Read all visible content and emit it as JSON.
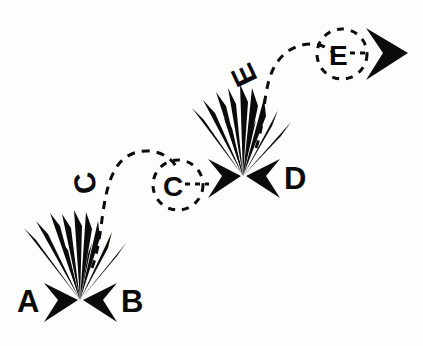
{
  "figure": {
    "title": "",
    "background_color": "#fdfdfc",
    "ink_color": "#0b0b0b",
    "width": 423,
    "height": 346
  },
  "labels": {
    "a": "A",
    "b": "B",
    "c_trajectory": "C",
    "c_circle": "C",
    "d": "D",
    "e_trajectory": "E",
    "e_circle": "E"
  },
  "events": [
    {
      "name": "first-collision",
      "incoming": [
        "A",
        "B"
      ],
      "outgoing": [
        "C"
      ],
      "vertex": [
        80,
        300
      ]
    },
    {
      "name": "second-collision",
      "incoming": [
        "C",
        "D"
      ],
      "outgoing": [
        "E"
      ],
      "vertex": [
        243,
        176
      ]
    },
    {
      "name": "final-emission",
      "incoming": [
        "E"
      ],
      "outgoing": [],
      "vertex": [
        380,
        52
      ]
    }
  ],
  "glyphs": {
    "arrow_right": "arrowhead-right",
    "arrow_left": "arrowhead-left",
    "burst": "collision-burst",
    "dashed_circle": "dashed-circle",
    "dashed_arc": "dashed-trajectory",
    "dashed_arrow": "dashed-arrow"
  }
}
